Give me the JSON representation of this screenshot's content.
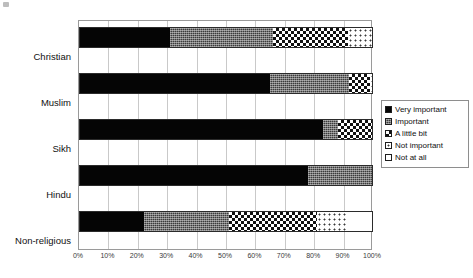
{
  "chart_data": {
    "type": "bar",
    "orientation": "horizontal",
    "stacked": true,
    "normalized_percent": true,
    "title": "",
    "subtitle": "",
    "xlabel": "",
    "ylabel": "",
    "xlim": [
      0,
      100
    ],
    "grid": true,
    "legend_position": "right",
    "categories": [
      "Christian",
      "Muslim",
      "Sikh",
      "Hindu",
      "Non-religious"
    ],
    "tick_labels": [
      "0%",
      "10%",
      "20%",
      "30%",
      "40%",
      "50%",
      "60%",
      "70%",
      "80%",
      "90%",
      "100%"
    ],
    "tick_values": [
      0,
      10,
      20,
      30,
      40,
      50,
      60,
      70,
      80,
      90,
      100
    ],
    "series": [
      {
        "name": "Very important",
        "pattern": "solid-black",
        "color": "#050505",
        "values": [
          31,
          65,
          83,
          78,
          22
        ]
      },
      {
        "name": "Important",
        "pattern": "dense-dark-dots",
        "color": "#3b3b3b",
        "values": [
          35,
          27,
          5,
          22,
          29
        ]
      },
      {
        "name": "A little bit",
        "pattern": "checkerboard",
        "color": "#111111",
        "values": [
          25.5,
          7,
          12,
          0,
          30
        ]
      },
      {
        "name": "Not important",
        "pattern": "sparse-dots",
        "color": "#3a3a3a",
        "values": [
          8.5,
          0.5,
          0,
          0,
          10.5
        ]
      },
      {
        "name": "Not at all",
        "pattern": "white",
        "color": "#ffffff",
        "values": [
          0,
          0.5,
          0,
          0,
          8.5
        ]
      }
    ]
  },
  "legend": {
    "items": [
      {
        "label": "Very important",
        "swatch": "legend-swatch-very-important"
      },
      {
        "label": "Important",
        "swatch": "legend-swatch-important"
      },
      {
        "label": "A little bit",
        "swatch": "legend-swatch-a-little-bit"
      },
      {
        "label": "Not important",
        "swatch": "legend-swatch-not-important"
      },
      {
        "label": "Not at all",
        "swatch": "legend-swatch-not-at-all"
      }
    ]
  }
}
